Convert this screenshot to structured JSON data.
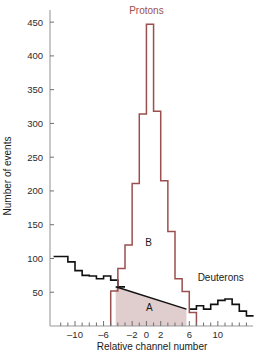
{
  "chart_data": {
    "type": "bar",
    "title": "",
    "xlabel": "Relative channel number",
    "ylabel": "Number of events",
    "xlim": [
      -13.5,
      14.5
    ],
    "ylim": [
      0,
      465
    ],
    "grid": false,
    "legend_position": "inline-annotations",
    "x_ticks_major": [
      -10,
      -6,
      -2,
      0,
      2,
      6,
      10
    ],
    "x_tick_labels": [
      "–10",
      "–6",
      "–2",
      "0",
      "2",
      "6",
      "10"
    ],
    "x_ticks_minor": [
      -12,
      -11,
      -9,
      -8,
      -7,
      -5,
      -4,
      -3,
      -1,
      1,
      3,
      4,
      5,
      7,
      8,
      9,
      11,
      12,
      13,
      14
    ],
    "y_ticks": [
      50,
      100,
      150,
      200,
      250,
      300,
      350,
      400,
      450
    ],
    "y_tick_labels": [
      "50",
      "100",
      "150",
      "200",
      "250",
      "300",
      "350",
      "400",
      "450"
    ],
    "bin_width": 1,
    "series": [
      {
        "name": "background-continuum",
        "color": "#111111",
        "style": "step-histogram",
        "x": [
          -13,
          -12,
          -11,
          -10,
          -9,
          -8,
          -7,
          -6,
          -5,
          -4,
          -3,
          -2,
          -1,
          0,
          1,
          2,
          3,
          4,
          5,
          6,
          7,
          8,
          9,
          10,
          11,
          12,
          13,
          14
        ],
        "values": [
          103,
          103,
          95,
          82,
          75,
          74,
          70,
          74,
          68,
          58,
          null,
          null,
          null,
          null,
          null,
          null,
          null,
          null,
          null,
          25,
          30,
          25,
          32,
          38,
          40,
          32,
          22,
          15
        ]
      },
      {
        "name": "proton-peak",
        "color": "#9c4f4f",
        "style": "step-histogram",
        "x": [
          -5,
          -4,
          -3,
          -2,
          -1,
          0,
          1,
          2,
          3,
          4,
          5,
          6
        ],
        "values": [
          52,
          85,
          120,
          211,
          314,
          447,
          318,
          215,
          140,
          70,
          51,
          20
        ]
      }
    ],
    "shaded_regions": [
      {
        "name": "region-A",
        "label": "A",
        "fill": "#e0cdcd",
        "x_start": -4.3,
        "x_end": 5.6,
        "y_start_top": 58,
        "y_end_top": 25,
        "description": "Background continuum under the proton peak"
      }
    ],
    "annotations": [
      {
        "name": "protons-label",
        "text": "Protons",
        "color": "#9c4f4f",
        "x": 0.0,
        "y": 462
      },
      {
        "name": "deuterons-label",
        "text": "Deuterons",
        "color": "#1a1a1a",
        "x": 10.4,
        "y": 66
      },
      {
        "name": "region-b-label",
        "text": "B",
        "color": "#1a1a1a",
        "x": 0.3,
        "y": 118
      },
      {
        "name": "region-a-label",
        "text": "A",
        "color": "#1a1a1a",
        "x": 0.4,
        "y": 22
      }
    ]
  },
  "colors": {
    "proton_red": "#9c4f4f",
    "histogram_black": "#111111",
    "shade_pink": "#e0cdcd",
    "axis_gray": "#9a9a9a",
    "background": "#ffffff"
  }
}
